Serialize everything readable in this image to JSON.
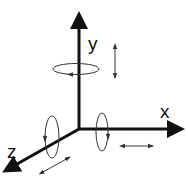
{
  "diagram": {
    "colors": {
      "axis": "#111111",
      "annotation": "#333333",
      "background": "#ffffff"
    },
    "axes": [
      {
        "id": "y",
        "label": "y",
        "direction": "up"
      },
      {
        "id": "x",
        "label": "x",
        "direction": "right"
      },
      {
        "id": "z",
        "label": "z",
        "direction": "down-left"
      }
    ],
    "rotations": [
      {
        "axis": "y",
        "description": "rotation ring around y axis"
      },
      {
        "axis": "x",
        "description": "rotation ring around x axis"
      },
      {
        "axis": "z",
        "description": "rotation ring around z axis"
      }
    ],
    "translations": [
      {
        "axis": "y",
        "description": "double-headed translation arrow parallel to y"
      },
      {
        "axis": "x",
        "description": "double-headed translation arrow parallel to x"
      },
      {
        "axis": "z",
        "description": "double-headed translation arrow parallel to z"
      }
    ]
  }
}
